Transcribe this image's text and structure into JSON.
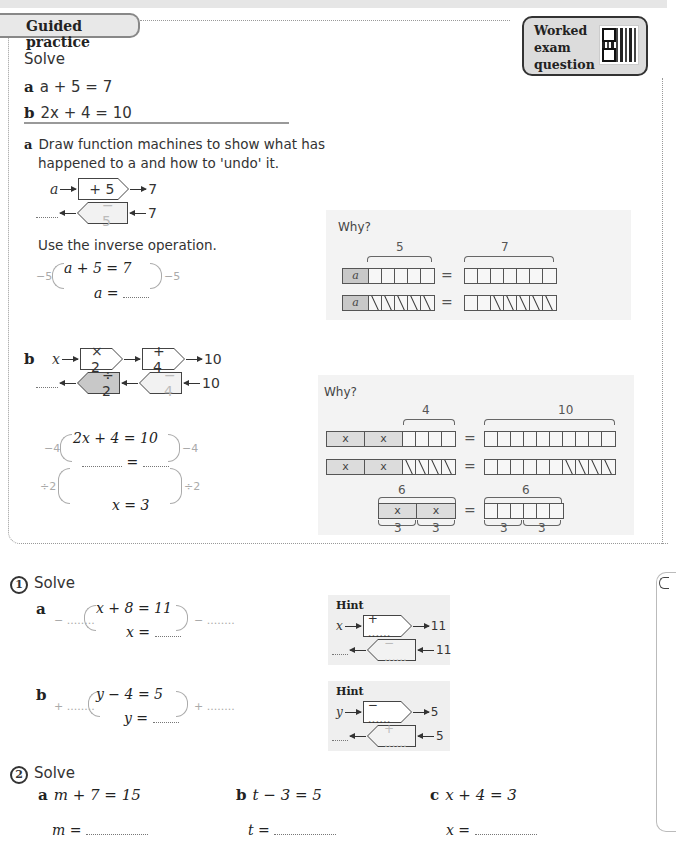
{
  "header": {
    "section_title": "Guided practice",
    "worked_exam": [
      "Worked",
      "exam",
      "question"
    ]
  },
  "intro": {
    "instruction": "Solve",
    "parts": [
      {
        "label": "a",
        "equation": "a + 5 = 7"
      },
      {
        "label": "b",
        "equation": "2x + 4 = 10"
      }
    ]
  },
  "part_a": {
    "label": "a",
    "text_line1": "Draw function machines to show what has",
    "text_line2": "happened to a and how to 'undo' it.",
    "machine_forward": {
      "input": "a",
      "op": "+ 5",
      "output": "7"
    },
    "machine_inverse": {
      "input": "7",
      "op": "− 5",
      "output": "........"
    },
    "inverse_text": "Use the inverse operation.",
    "working": {
      "left_op": "−5",
      "right_op": "−5",
      "line1": "a + 5 = 7",
      "line2_lhs": "a =",
      "line2_blank": "........"
    },
    "why": {
      "title": "Why?",
      "top_brace_left": "5",
      "top_brace_right": "7",
      "var_label": "a",
      "equals": "="
    }
  },
  "part_b": {
    "label": "b",
    "machine_forward": [
      {
        "input": "x"
      },
      {
        "op": "× 2"
      },
      {
        "op": "+ 4"
      },
      {
        "output": "10"
      }
    ],
    "machine_inverse": [
      {
        "input": "10"
      },
      {
        "op": "− 4"
      },
      {
        "op": "÷ 2"
      },
      {
        "output": "........"
      }
    ],
    "working": {
      "step1_op": "−4",
      "step2_op": "÷2",
      "line1": "2x + 4 = 10",
      "line2": "=",
      "line3": "x = 3"
    },
    "why": {
      "title": "Why?",
      "brace_4": "4",
      "brace_10": "10",
      "brace_6_left": "6",
      "brace_6_right": "6",
      "under_3": [
        "3",
        "3",
        "3",
        "3"
      ],
      "var_label": "x",
      "equals": "="
    }
  },
  "q1": {
    "number": "1",
    "instruction": "Solve",
    "a": {
      "label": "a",
      "line1": "x + 8 = 11",
      "line2": "x =",
      "left_op": "− ........",
      "right_op": "− ........",
      "hint": {
        "title": "Hint",
        "input": "x",
        "op_forward": "+ ......",
        "output": "11",
        "op_inverse": "− ......",
        "inverse_input": "11",
        "inverse_output": "........"
      }
    },
    "b": {
      "label": "b",
      "line1": "y − 4 = 5",
      "line2": "y =",
      "left_op": "+ ........",
      "right_op": "+ ........",
      "hint": {
        "title": "Hint",
        "input": "y",
        "op_forward": "− ......",
        "output": "5",
        "op_inverse": "+ ......",
        "inverse_input": "5",
        "inverse_output": "........"
      }
    }
  },
  "q2": {
    "number": "2",
    "instruction": "Solve",
    "parts": [
      {
        "label": "a",
        "equation": "m + 7 = 15",
        "answer_lhs": "m ="
      },
      {
        "label": "b",
        "equation": "t − 3 = 5",
        "answer_lhs": "t ="
      },
      {
        "label": "c",
        "equation": "x + 4 = 3",
        "answer_lhs": "x ="
      }
    ]
  }
}
